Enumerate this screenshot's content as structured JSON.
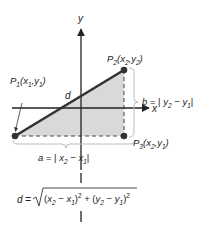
{
  "diagram": {
    "type": "distance-formula-coordinate-diagram",
    "axes": {
      "x_label": "x",
      "y_label": "y"
    },
    "points": {
      "p1": {
        "name": "P",
        "index": "1",
        "coords_text": "(x₁,y₁)",
        "x_var": "x",
        "x_sub": "1",
        "y_var": "y",
        "y_sub": "1"
      },
      "p2": {
        "name": "P",
        "index": "2",
        "coords_text": "(x₂,y₂)",
        "x_var": "x",
        "x_sub": "2",
        "y_var": "y",
        "y_sub": "2"
      },
      "p3": {
        "name": "P",
        "index": "3",
        "coords_text": "(x₂,y₁)",
        "x_var": "x",
        "x_sub": "2",
        "y_var": "y",
        "y_sub": "1"
      }
    },
    "hypotenuse_label": "d",
    "side_b": {
      "letter": "b",
      "expression": "b = | y₂ − y₁ |"
    },
    "side_a": {
      "letter": "a",
      "expression": "a = | x₂ − x₁ |"
    },
    "formula": {
      "lhs": "d",
      "text": "d = √((x₂ − x₁)² + (y₂ − y₁)²)"
    },
    "colors": {
      "triangle_fill": "#d9d9d9",
      "line": "#222222",
      "point": "#333333",
      "brace": "#bdbdbd",
      "dashed": "#444444"
    }
  }
}
